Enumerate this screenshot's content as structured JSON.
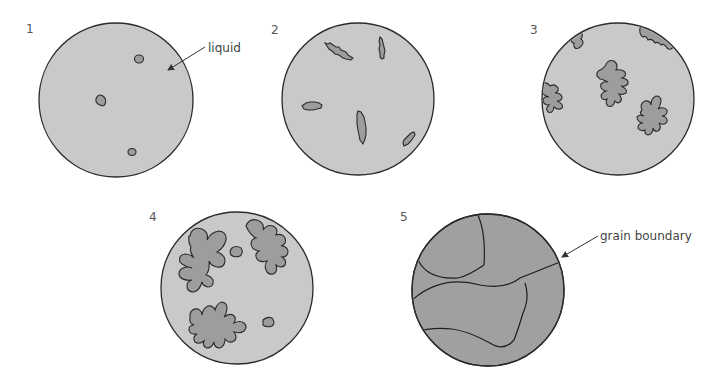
{
  "figure": {
    "colors": {
      "liquid": "#c9c9c9",
      "solid": "#9d9d9d",
      "outline": "#2a2a2a"
    },
    "stages": [
      {
        "number": "1",
        "description": "small solid nuclei in liquid",
        "annotation": "liquid"
      },
      {
        "number": "2",
        "description": "nuclei grow into jagged crystals"
      },
      {
        "number": "3",
        "description": "dendritic crystal growth"
      },
      {
        "number": "4",
        "description": "dendrites impinge, liquid remains between"
      },
      {
        "number": "5",
        "description": "fully solid with grains",
        "annotation": "grain boundary"
      }
    ]
  }
}
